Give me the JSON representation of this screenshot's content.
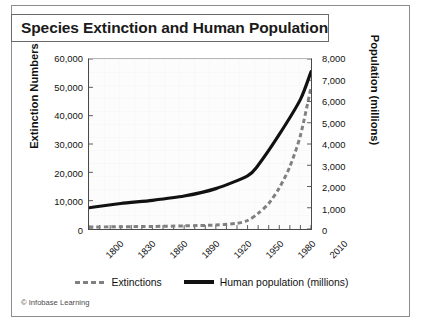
{
  "figure": {
    "title": "Species Extinction and Human Population",
    "credit": "© Infobase Learning"
  },
  "axes": {
    "y_left_title": "Extinction Numbers",
    "y_right_title": "Population (millions)"
  },
  "legend": {
    "items": [
      {
        "label": "Extinctions",
        "style": "dashed",
        "color": "#808080"
      },
      {
        "label": "Human population (millions)",
        "style": "solid",
        "color": "#111111"
      }
    ]
  },
  "chart_data": {
    "type": "line",
    "title": "Species Extinction and Human Population",
    "xlabel": "",
    "ylabel": "Extinction Numbers",
    "y2label": "Population (millions)",
    "xlim": [
      1800,
      2010
    ],
    "ylim": [
      0,
      60000
    ],
    "y2lim": [
      0,
      8000
    ],
    "xticks": [
      1800,
      1830,
      1860,
      1890,
      1920,
      1950,
      1980,
      2010
    ],
    "xtick_labels": [
      "1800",
      "1830",
      "1860",
      "1890",
      "1920",
      "1950",
      "1980",
      "2010"
    ],
    "xminor_step": 10,
    "yticks": [
      0,
      10000,
      20000,
      30000,
      40000,
      50000,
      60000
    ],
    "ytick_labels": [
      "0",
      "10,000",
      "20,000",
      "30,000",
      "40,000",
      "50,000",
      "60,000"
    ],
    "y2ticks": [
      0,
      1000,
      2000,
      3000,
      4000,
      5000,
      6000,
      7000,
      8000
    ],
    "y2tick_labels": [
      "0",
      "1,000",
      "2,000",
      "3,000",
      "4,000",
      "5,000",
      "6,000",
      "7,000",
      "8,000"
    ],
    "grid": false,
    "legend_position": "bottom",
    "series": [
      {
        "name": "Human population (millions)",
        "axis": "right",
        "style": "solid",
        "color": "#111111",
        "x": [
          1800,
          1830,
          1860,
          1890,
          1920,
          1950,
          1960,
          1980,
          2000,
          2010
        ],
        "values": [
          1000,
          1200,
          1350,
          1550,
          1900,
          2500,
          3000,
          4450,
          6100,
          7400
        ]
      },
      {
        "name": "Extinctions",
        "axis": "left",
        "style": "dashed",
        "color": "#808080",
        "x": [
          1800,
          1830,
          1860,
          1890,
          1920,
          1940,
          1950,
          1960,
          1970,
          1980,
          1990,
          2000,
          2010
        ],
        "values": [
          700,
          800,
          900,
          1100,
          1400,
          2000,
          3000,
          5500,
          9000,
          14500,
          22000,
          33000,
          50000
        ]
      }
    ]
  }
}
